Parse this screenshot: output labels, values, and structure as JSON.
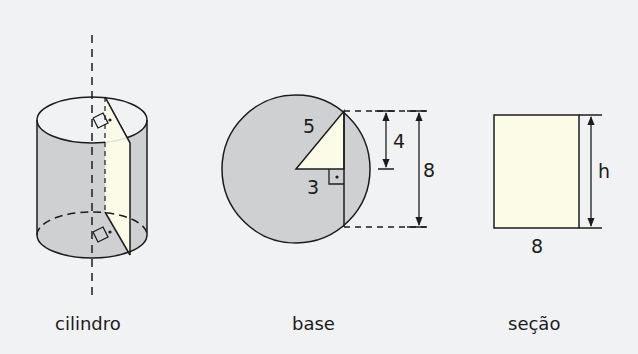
{
  "figure": {
    "colors": {
      "background": "#f1f2f4",
      "shaded": "#cfd0d2",
      "section_fill": "#fbfbe8",
      "stroke": "#1c1c1c"
    },
    "cylinder": {
      "caption": "cilindro"
    },
    "base": {
      "caption": "base",
      "hypotenuse_label": "5",
      "distance_label": "3",
      "half_chord_label": "4",
      "chord_label": "8"
    },
    "section": {
      "caption": "seção",
      "width_label": "8",
      "height_label": "h"
    }
  }
}
